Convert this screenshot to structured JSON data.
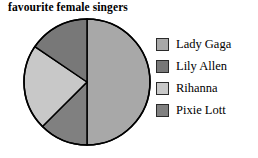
{
  "chart_data": {
    "type": "pie",
    "title": "favourite female singers",
    "categories": [
      "Lady Gaga",
      "Lily Allen",
      "Rihanna",
      "Pixie Lott"
    ],
    "values": [
      50,
      15.5,
      22,
      12.5
    ],
    "value_unit": "percent",
    "colors": [
      "#a8a8a8",
      "#787878",
      "#c8c8c8",
      "#808080"
    ],
    "slice_order_clockwise_from_12": [
      "Lady Gaga",
      "Pixie Lott",
      "Rihanna",
      "Lily Allen"
    ],
    "start_angle_deg": 0,
    "direction": "clockwise",
    "outline_color": "#000000",
    "legend_position": "right",
    "grid": false,
    "xlabel": "",
    "ylabel": ""
  },
  "legend": {
    "items": [
      {
        "label": "Lady Gaga",
        "color": "#a8a8a8"
      },
      {
        "label": "Lily Allen",
        "color": "#787878"
      },
      {
        "label": "Rihanna",
        "color": "#c8c8c8"
      },
      {
        "label": "Pixie Lott",
        "color": "#808080"
      }
    ]
  }
}
